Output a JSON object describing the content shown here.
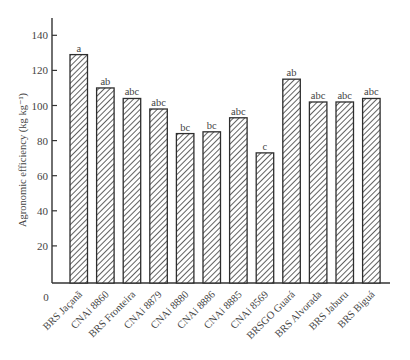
{
  "chart_data": {
    "type": "bar",
    "title": "",
    "xlabel": "",
    "ylabel": "Agronomic efficiency (kg kg⁻¹)",
    "ylim": [
      0,
      150
    ],
    "yticks": [
      20,
      40,
      60,
      80,
      100,
      120,
      140
    ],
    "origin_label": "0",
    "grid": false,
    "legend": null,
    "pattern": "diagonal-hatch",
    "categories": [
      "BRS Jaçanã",
      "CNAi 8860",
      "BRS Fronteira",
      "CNAi 8879",
      "CNAi 8880",
      "CNAi 8886",
      "CNAi 8885",
      "CNAi 8569",
      "BRSGO Guará",
      "BRS Alvorada",
      "BRS Jaburu",
      "BRS Biguá"
    ],
    "values": [
      129,
      110,
      104,
      98,
      84,
      85,
      93,
      73,
      115,
      102,
      102,
      104
    ],
    "annotations": [
      "a",
      "ab",
      "abc",
      "abc",
      "bc",
      "bc",
      "abc",
      "c",
      "ab",
      "abc",
      "abc",
      "abc"
    ]
  }
}
